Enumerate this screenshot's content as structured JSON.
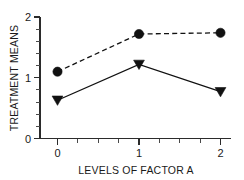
{
  "chart_data": {
    "type": "line",
    "title": "",
    "subtitle": "",
    "xlabel": "LEVELS OF FACTOR A",
    "ylabel": "TREATMENT MEANS",
    "x": [
      0,
      1,
      2
    ],
    "categories": [
      "0",
      "1",
      "2"
    ],
    "xlim": [
      -0.3,
      2.3
    ],
    "ylim": [
      0,
      2
    ],
    "grid": false,
    "legend": "none",
    "xticks": [
      "0",
      "1",
      "2"
    ],
    "yticks": [
      "0",
      "1",
      "2"
    ],
    "x_minor_ticks_per_interval": 4,
    "y_minor_ticks_per_interval": 5,
    "series": [
      {
        "name": "circle-series",
        "marker": "circle",
        "linestyle": "dashed",
        "color": "#111111",
        "values": [
          1.1,
          1.72,
          1.74
        ]
      },
      {
        "name": "triangle-series",
        "marker": "triangle-down",
        "linestyle": "solid",
        "color": "#111111",
        "values": [
          0.63,
          1.22,
          0.77
        ]
      }
    ]
  },
  "axis_labels": {
    "x_title": "LEVELS OF FACTOR A",
    "y_title": "TREATMENT MEANS",
    "x_tick_0": "0",
    "x_tick_1": "1",
    "x_tick_2": "2",
    "y_tick_0": "0",
    "y_tick_1": "1",
    "y_tick_2": "2"
  }
}
